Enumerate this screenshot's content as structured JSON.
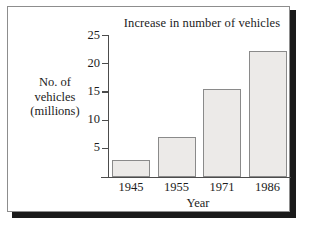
{
  "chart_data": {
    "type": "bar",
    "title": "Increase in number of vehicles",
    "xlabel": "Year",
    "ylabel": "No. of vehicles (millions)",
    "ylabel_lines": [
      "No. of",
      "vehicles",
      "(millions)"
    ],
    "categories": [
      "1945",
      "1955",
      "1971",
      "1986"
    ],
    "values": [
      3,
      7,
      15.5,
      22.3
    ],
    "yticks": [
      5,
      10,
      15,
      20,
      25
    ],
    "ylim": [
      0,
      25
    ],
    "grid": false,
    "legend": false,
    "bar_fill": "#eceae8",
    "bar_stroke": "#8a8a8a",
    "axis_color": "#4c4c4c",
    "text_color": "#1c1c1c"
  }
}
